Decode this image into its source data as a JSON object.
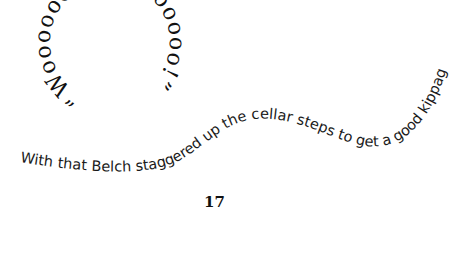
{
  "page": {
    "exclamation": "“Wooooooo Hoooooooo!”",
    "sentence": "With that Belch staggered up the cellar steps to get a good kippage.",
    "page_number": "17"
  },
  "colors": {
    "text": "#111111",
    "background": "#ffffff"
  }
}
